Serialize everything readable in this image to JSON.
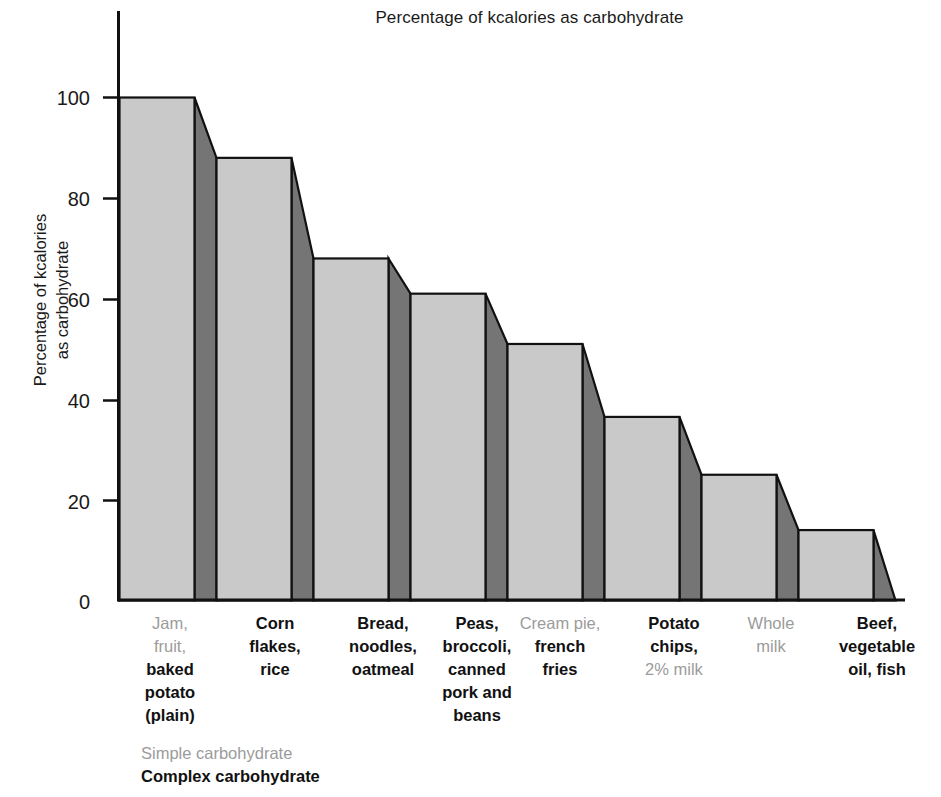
{
  "chart_data": {
    "type": "bar",
    "title": "Percentage of kcalories as carbohydrate",
    "xlabel": "",
    "ylabel": "Percentage of kcalories\nas carbohydrate",
    "ylabel_line1": "Percentage of kcalories",
    "ylabel_line2": "as carbohydrate",
    "ylim": [
      0,
      100
    ],
    "yticks": [
      0,
      20,
      40,
      60,
      80,
      100
    ],
    "ytick_labels": [
      "0",
      "20",
      "40",
      "60",
      "80",
      "100"
    ],
    "grid": false,
    "legend_position": "below-left",
    "categories": [
      "Jam, fruit, baked potato (plain)",
      "Corn flakes, rice",
      "Bread, noodles, oatmeal",
      "Peas, broccoli, canned pork and beans",
      "Cream pie, french fries",
      "Potato chips, 2% milk",
      "Whole milk",
      "Beef, vegetable oil, fish"
    ],
    "values": [
      100,
      88,
      68,
      61,
      51,
      36.5,
      25,
      14
    ],
    "series": [
      {
        "name": "Percentage of kcalories as carbohydrate",
        "values": [
          100,
          88,
          68,
          61,
          51,
          36.5,
          25,
          14
        ]
      }
    ],
    "annotations": [
      "Bars are drawn in a stepped 3-D style: a light-gray front face for each food group with a darker-gray bevel panel sloping down to the next, lower bar."
    ]
  },
  "legend": {
    "simple_label": "Simple carbohydrate",
    "complex_label": "Complex carbohydrate",
    "simple_color": "#9b9b9b",
    "complex_color": "#111111"
  },
  "colors": {
    "bar_front": "#c9c9c9",
    "bar_side": "#757575",
    "outline": "#111111",
    "background": "#ffffff",
    "text": "#1a1a1a"
  },
  "axis": {
    "tick_100": "100",
    "tick_80": "80",
    "tick_60": "60",
    "tick_40": "40",
    "tick_20": "20",
    "tick_0": "0"
  },
  "category_labels": [
    {
      "lines": [
        {
          "text": "Jam,",
          "style": "simple"
        },
        {
          "text": "fruit,",
          "style": "simple"
        },
        {
          "text": "baked",
          "style": "complex"
        },
        {
          "text": "potato",
          "style": "complex"
        },
        {
          "text": "(plain)",
          "style": "complex"
        }
      ]
    },
    {
      "lines": [
        {
          "text": "Corn",
          "style": "complex"
        },
        {
          "text": "flakes,",
          "style": "complex"
        },
        {
          "text": "rice",
          "style": "complex"
        }
      ]
    },
    {
      "lines": [
        {
          "text": "Bread,",
          "style": "complex"
        },
        {
          "text": "noodles,",
          "style": "complex"
        },
        {
          "text": "oatmeal",
          "style": "complex"
        }
      ]
    },
    {
      "lines": [
        {
          "text": "Peas,",
          "style": "complex"
        },
        {
          "text": "broccoli,",
          "style": "complex"
        },
        {
          "text": "canned",
          "style": "complex"
        },
        {
          "text": "pork and",
          "style": "complex"
        },
        {
          "text": "beans",
          "style": "complex"
        }
      ]
    },
    {
      "lines": [
        {
          "text": "Cream pie,",
          "style": "simple"
        },
        {
          "text": "french",
          "style": "complex"
        },
        {
          "text": "fries",
          "style": "complex"
        }
      ]
    },
    {
      "lines": [
        {
          "text": "Potato",
          "style": "complex"
        },
        {
          "text": "chips,",
          "style": "complex"
        },
        {
          "text": "2% milk",
          "style": "simple"
        }
      ]
    },
    {
      "lines": [
        {
          "text": "Whole",
          "style": "simple"
        },
        {
          "text": "milk",
          "style": "simple"
        }
      ]
    },
    {
      "lines": [
        {
          "text": "Beef,",
          "style": "complex"
        },
        {
          "text": "vegetable",
          "style": "complex"
        },
        {
          "text": "oil, fish",
          "style": "complex"
        }
      ]
    }
  ]
}
